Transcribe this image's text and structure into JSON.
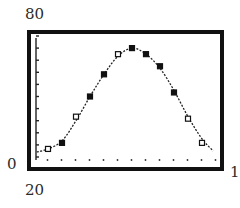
{
  "window": {
    "xmin_label": "0",
    "xmax_label": "13",
    "ymin_label": "20",
    "ymax_label": "80"
  },
  "chart_data": {
    "type": "scatter",
    "title": "",
    "xlabel": "",
    "ylabel": "",
    "xlim": [
      0,
      13
    ],
    "ylim": [
      20,
      80
    ],
    "grid": false,
    "x_tick_marks": [
      1,
      2,
      3,
      4,
      5,
      6,
      7,
      8,
      9,
      10,
      11,
      12,
      13
    ],
    "series": [
      {
        "name": "data points",
        "x": [
          1,
          2,
          3,
          4,
          5,
          6,
          7,
          8,
          9,
          10,
          11,
          12
        ],
        "y": [
          24,
          27,
          40,
          50,
          61,
          71,
          74,
          71,
          65,
          52,
          39,
          27
        ],
        "marker": [
          "open",
          "filled",
          "open",
          "filled",
          "filled",
          "open",
          "filled",
          "filled",
          "filled",
          "filled",
          "open",
          "open"
        ]
      },
      {
        "name": "fitted sinusoidal curve",
        "style": "dotted line",
        "x": [
          0.2,
          1,
          2,
          3,
          4,
          5,
          6,
          7,
          8,
          9,
          10,
          11,
          12,
          12.8
        ],
        "y": [
          22.5,
          24,
          28,
          38,
          50,
          61,
          70,
          74,
          71,
          64,
          53,
          40,
          29,
          23
        ]
      }
    ]
  },
  "colors": {
    "frame": "#111111",
    "curve": "#222222",
    "background": "#ffffff"
  }
}
